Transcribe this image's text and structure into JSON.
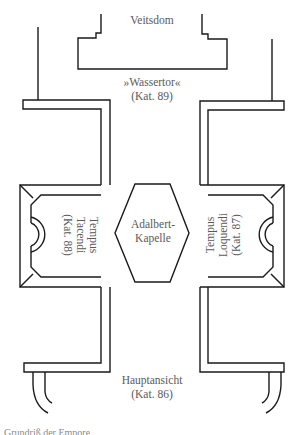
{
  "diagram": {
    "type": "floor-plan",
    "stroke_color": "#1a1a1a",
    "label_color": "#5a5a5a",
    "labels": {
      "top": "Veitsdom",
      "gate_name": "»Wassertor«",
      "gate_cat": "(Kat. 89)",
      "chapel_line1": "Adalbert-",
      "chapel_line2": "Kapelle",
      "left_line1": "Tempus",
      "left_line2": "Tacendi",
      "left_line3": "(Kat. 88)",
      "right_line1": "Tempus",
      "right_line2": "Loquendi",
      "right_line3": "(Kat. 87)",
      "bottom_name": "Hauptansicht",
      "bottom_cat": "(Kat. 86)"
    },
    "caption": "Grundriß der Empore"
  }
}
